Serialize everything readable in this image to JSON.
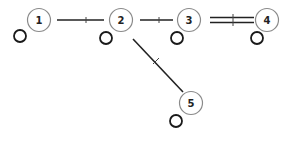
{
  "diagram": {
    "type": "directed-graph",
    "nodes": [
      {
        "id": "1",
        "label": "1",
        "x": 39,
        "y": 20,
        "self_loop": true
      },
      {
        "id": "2",
        "label": "2",
        "x": 121,
        "y": 20,
        "self_loop": true
      },
      {
        "id": "3",
        "label": "3",
        "x": 189,
        "y": 20,
        "self_loop": true
      },
      {
        "id": "4",
        "label": "4",
        "x": 267,
        "y": 20,
        "self_loop": true
      },
      {
        "id": "5",
        "label": "5",
        "x": 191,
        "y": 103,
        "self_loop": true
      }
    ],
    "edges": [
      {
        "from": "1",
        "to": "2",
        "style": "single"
      },
      {
        "from": "2",
        "to": "3",
        "style": "single"
      },
      {
        "from": "3",
        "to": "4",
        "style": "double"
      },
      {
        "from": "2",
        "to": "5",
        "style": "single"
      }
    ]
  }
}
